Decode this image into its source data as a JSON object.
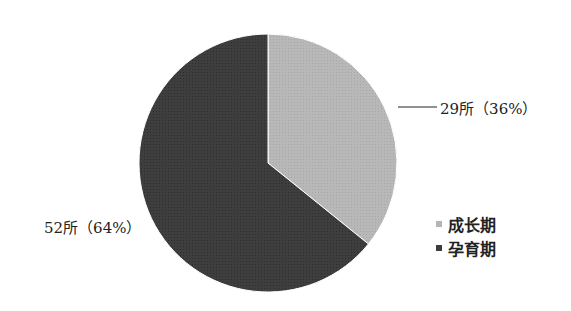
{
  "chart_data": {
    "type": "pie",
    "title": "",
    "categories": [
      "成长期",
      "孕育期"
    ],
    "values": [
      29,
      52
    ],
    "percentages": [
      36,
      64
    ],
    "data_labels": [
      "29所（36%）",
      "52所（64%）"
    ],
    "colors": [
      "#b5b5b5",
      "#3c3c3c"
    ],
    "start_angle": "12 o'clock, clockwise",
    "legend": {
      "position": "right-bottom",
      "entries": [
        "成长期",
        "孕育期"
      ]
    }
  },
  "labels": {
    "growth": "29所（36%）",
    "incubation": "52所（64%）"
  },
  "legend": {
    "items": [
      {
        "label": "成长期",
        "color": "#b5b5b5"
      },
      {
        "label": "孕育期",
        "color": "#3c3c3c"
      }
    ]
  }
}
